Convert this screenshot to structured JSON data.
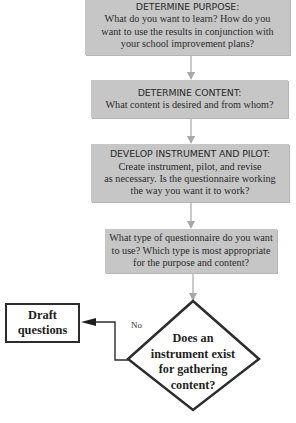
{
  "diagram": {
    "type": "flowchart",
    "steps": [
      {
        "id": "purpose",
        "title": "DETERMINE PURPOSE:",
        "body": "What do you want to learn? How do you\nwant to use the results in conjunction with\nyour school improvement plans?"
      },
      {
        "id": "content",
        "title": "DETERMINE CONTENT:",
        "body": "What content is desired and from whom?"
      },
      {
        "id": "develop",
        "title": "DEVELOP INSTRUMENT AND PILOT:",
        "body": "Create instrument, pilot, and revise\nas necessary. Is the questionnaire working\nthe way you want it to work?"
      },
      {
        "id": "type",
        "title": "",
        "body": "What type of questionnaire do you want\nto use? Which type is most appropriate\nfor the purpose and content?"
      }
    ],
    "decision": {
      "text": "Does an\ninstrument exist\nfor gathering\ncontent?",
      "no_label": "No"
    },
    "action": {
      "text": "Draft\nquestions"
    },
    "colors": {
      "box_fill": "#c6c6c6",
      "arrow": "#a8a8a8",
      "outline": "#2c2c2c"
    }
  }
}
